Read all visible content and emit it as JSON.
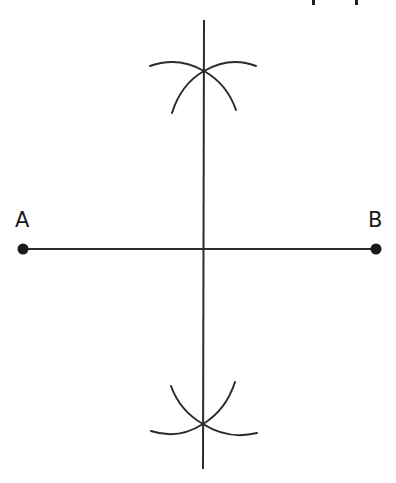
{
  "diagram": {
    "type": "geometric-construction",
    "colors": {
      "stroke": "#2b2b2b",
      "point": "#1a1a1a",
      "background": "#ffffff"
    },
    "points": [
      {
        "id": "A",
        "label": "A",
        "x": 23,
        "y": 249
      },
      {
        "id": "B",
        "label": "B",
        "x": 376,
        "y": 249
      }
    ],
    "segment_ab": {
      "from": "A",
      "to": "B"
    },
    "perpendicular_bisector": {
      "x1": 204,
      "y1": 20,
      "x2": 203,
      "y2": 469
    },
    "arc_intersections": [
      {
        "id": "top",
        "x": 204,
        "y": 71
      },
      {
        "id": "bottom",
        "x": 203,
        "y": 424
      }
    ],
    "top_cut_text_fragment": "pp (cropped descenders)"
  },
  "labels": {
    "a": "A",
    "b": "B"
  }
}
